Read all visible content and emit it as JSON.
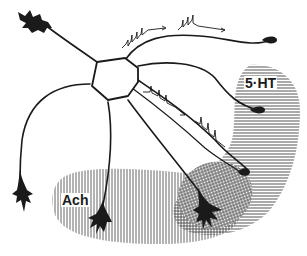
{
  "diagram": {
    "type": "neuron-neurotransmitter-diagram",
    "labels": {
      "serotonin": "5·HT",
      "acetylcholine": "Ach"
    },
    "regions": [
      {
        "name": "5-HT region",
        "pattern": "horizontal-lines",
        "label_ref": "serotonin"
      },
      {
        "name": "Ach region",
        "pattern": "vertical-lines",
        "label_ref": "acetylcholine"
      },
      {
        "name": "overlap region",
        "pattern": "crosshatch"
      }
    ],
    "elements": {
      "cell_body": "central polygonal soma",
      "dendrites": 6,
      "axons_with_spikes": 2,
      "terminal_boutons": 2,
      "pyramidal_cell_endings": 4
    },
    "colors": {
      "ink": "#1a1a1a",
      "hatch": "#555555",
      "background": "#ffffff"
    }
  }
}
